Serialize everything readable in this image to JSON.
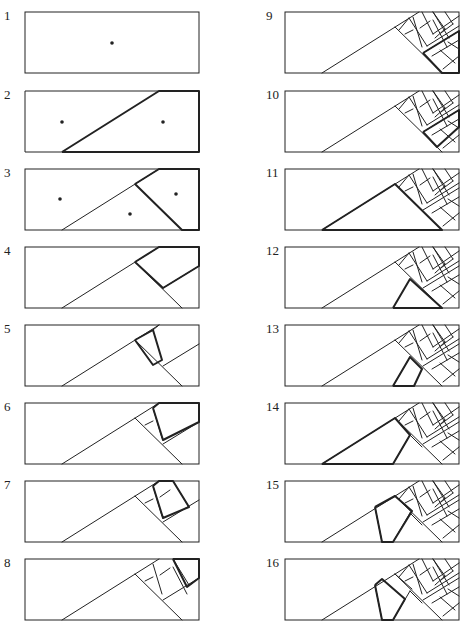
{
  "figure": {
    "stroke_color": "#222222",
    "panels": [
      {
        "label": "1"
      },
      {
        "label": "2"
      },
      {
        "label": "3"
      },
      {
        "label": "4"
      },
      {
        "label": "5"
      },
      {
        "label": "6"
      },
      {
        "label": "7"
      },
      {
        "label": "8"
      },
      {
        "label": "9"
      },
      {
        "label": "10"
      },
      {
        "label": "11"
      },
      {
        "label": "12"
      },
      {
        "label": "13"
      },
      {
        "label": "14"
      },
      {
        "label": "15"
      },
      {
        "label": "16"
      }
    ]
  }
}
